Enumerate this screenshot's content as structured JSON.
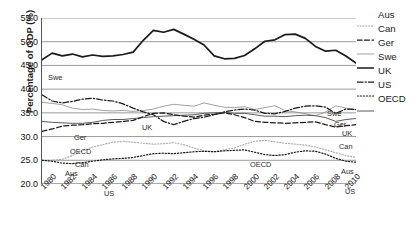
{
  "axis": {
    "ylabel": "Percentage of GDP (%)",
    "yticks": [
      "55.0",
      "50.0",
      "45.0",
      "40.0",
      "35.0",
      "30.0",
      "25.0",
      "20.0"
    ],
    "xticks": [
      "1980",
      "1982",
      "1984",
      "1986",
      "1988",
      "1990",
      "1992",
      "1994",
      "1996",
      "1998",
      "2000",
      "2002",
      "2004",
      "2006",
      "2008",
      "2010"
    ]
  },
  "legend": [
    {
      "label": "Aus",
      "style": "dotted-fine",
      "color": "#aaaaaa"
    },
    {
      "label": "Can",
      "style": "dashed",
      "color": "#1a1a1a"
    },
    {
      "label": "Ger",
      "style": "solid-thin",
      "color": "#8c8c8c"
    },
    {
      "label": "Swe",
      "style": "solid-bold",
      "color": "#1a1a1a"
    },
    {
      "label": "UK",
      "style": "dash-dot",
      "color": "#1a1a1a"
    },
    {
      "label": "US",
      "style": "dotted",
      "color": "#1a1a1a"
    },
    {
      "label": "OECD",
      "style": "solid-mid",
      "color": "#555555"
    }
  ],
  "inline_labels": [
    {
      "text": "Swe",
      "x": 6,
      "y": 56
    },
    {
      "text": "Swe",
      "x": 285,
      "y": 92
    },
    {
      "text": "Ger",
      "x": 32,
      "y": 116
    },
    {
      "text": "Ger",
      "x": 292,
      "y": 103
    },
    {
      "text": "UK",
      "x": 100,
      "y": 106
    },
    {
      "text": "UK",
      "x": 300,
      "y": 112
    },
    {
      "text": "OECD",
      "x": 28,
      "y": 130
    },
    {
      "text": "OECD",
      "x": 208,
      "y": 143
    },
    {
      "text": "Can",
      "x": 33,
      "y": 143
    },
    {
      "text": "Can",
      "x": 297,
      "y": 125
    },
    {
      "text": "Aus",
      "x": 23,
      "y": 152
    },
    {
      "text": "Aus",
      "x": 299,
      "y": 150
    },
    {
      "text": "US",
      "x": 62,
      "y": 172
    },
    {
      "text": "US",
      "x": 303,
      "y": 170
    }
  ],
  "chart_data": {
    "type": "line",
    "title": "",
    "xlabel": "",
    "ylabel": "Percentage of GDP (%)",
    "ylim": [
      20.0,
      55.0
    ],
    "xlim": [
      1980,
      2011
    ],
    "grid": "horizontal",
    "legend_position": "right",
    "x": [
      1980,
      1981,
      1982,
      1983,
      1984,
      1985,
      1986,
      1987,
      1988,
      1989,
      1990,
      1991,
      1992,
      1993,
      1994,
      1995,
      1996,
      1997,
      1998,
      1999,
      2000,
      2001,
      2002,
      2003,
      2004,
      2005,
      2006,
      2007,
      2008,
      2009,
      2010,
      2011
    ],
    "series": [
      {
        "name": "Swe",
        "style": "solid-bold",
        "values": [
          46.2,
          47.6,
          47.0,
          47.4,
          46.8,
          47.2,
          46.9,
          47.0,
          47.3,
          47.8,
          50.3,
          52.4,
          52.0,
          52.6,
          51.6,
          50.5,
          49.3,
          47.0,
          46.4,
          46.5,
          47.1,
          48.5,
          50.1,
          50.4,
          51.5,
          51.6,
          50.7,
          49.0,
          48.0,
          48.2,
          47.0,
          45.5
        ]
      },
      {
        "name": "Ger",
        "style": "solid-thin",
        "values": [
          37.2,
          37.0,
          36.7,
          36.0,
          35.7,
          35.8,
          35.5,
          35.4,
          35.5,
          35.3,
          35.5,
          35.8,
          36.4,
          36.8,
          36.6,
          36.4,
          37.1,
          36.6,
          36.2,
          36.1,
          36.3,
          35.7,
          36.1,
          36.5,
          35.5,
          35.2,
          34.8,
          34.4,
          35.2,
          36.5,
          36.0,
          35.7
        ]
      },
      {
        "name": "UK",
        "style": "dash-dot",
        "values": [
          38.8,
          37.5,
          37.1,
          37.4,
          37.9,
          38.1,
          37.7,
          37.5,
          36.9,
          36.0,
          35.2,
          34.6,
          33.2,
          32.5,
          33.2,
          33.8,
          34.1,
          34.6,
          35.2,
          35.6,
          35.8,
          35.6,
          34.9,
          34.8,
          35.3,
          36.0,
          36.4,
          36.5,
          36.2,
          34.9,
          35.8,
          35.7
        ]
      },
      {
        "name": "OECD",
        "style": "solid-mid",
        "values": [
          33.2,
          33.0,
          32.9,
          32.8,
          32.8,
          33.0,
          33.4,
          33.6,
          33.6,
          33.8,
          34.0,
          34.2,
          34.3,
          34.4,
          34.5,
          34.6,
          34.9,
          35.0,
          35.1,
          34.9,
          34.9,
          34.6,
          34.3,
          34.3,
          34.2,
          34.4,
          34.5,
          34.4,
          34.0,
          33.2,
          33.6,
          33.8
        ]
      },
      {
        "name": "Can",
        "style": "dashed",
        "values": [
          31.1,
          31.6,
          32.2,
          32.4,
          32.5,
          32.7,
          32.8,
          33.0,
          33.2,
          33.4,
          34.2,
          34.9,
          35.0,
          34.6,
          34.3,
          34.1,
          34.5,
          34.7,
          35.0,
          34.6,
          34.0,
          33.2,
          33.0,
          32.9,
          32.8,
          32.9,
          33.0,
          33.1,
          32.5,
          32.0,
          32.3,
          32.5
        ]
      },
      {
        "name": "Aus",
        "style": "dotted-fine",
        "values": [
          25.0,
          25.0,
          25.2,
          26.0,
          27.0,
          27.8,
          28.3,
          28.8,
          29.0,
          28.8,
          28.6,
          28.4,
          28.5,
          28.7,
          28.3,
          27.6,
          27.0,
          26.8,
          27.2,
          27.6,
          28.4,
          29.0,
          29.2,
          28.9,
          28.6,
          28.4,
          28.2,
          27.8,
          27.2,
          26.6,
          26.0,
          25.6
        ]
      },
      {
        "name": "US",
        "style": "dotted",
        "values": [
          25.0,
          24.8,
          24.4,
          24.3,
          24.5,
          24.8,
          25.1,
          25.3,
          25.4,
          25.6,
          26.0,
          26.4,
          26.5,
          26.4,
          26.6,
          26.8,
          26.9,
          26.8,
          27.0,
          27.1,
          27.2,
          26.7,
          26.2,
          26.0,
          26.2,
          26.7,
          27.0,
          26.9,
          26.3,
          25.4,
          24.8,
          24.6
        ]
      }
    ]
  }
}
